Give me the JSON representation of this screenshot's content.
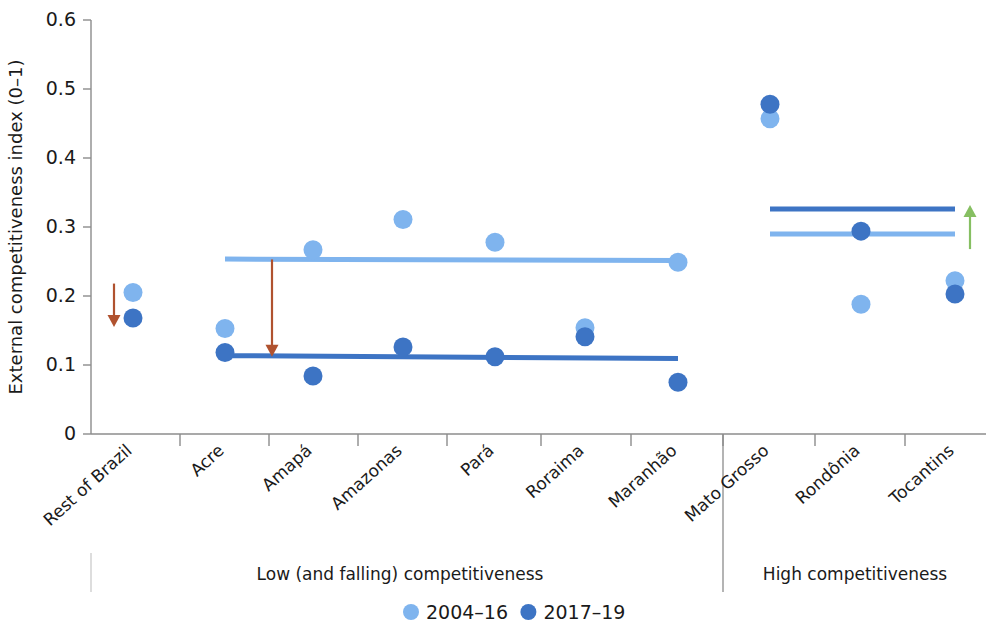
{
  "chart_data": {
    "type": "scatter",
    "title": "",
    "xlabel": "",
    "ylabel": "External competitiveness index (0–1)",
    "ylim": [
      0,
      0.6
    ],
    "yticks": [
      0,
      0.1,
      0.2,
      0.3,
      0.4,
      0.5,
      0.6
    ],
    "ytick_labels": [
      "0",
      "0.1",
      "0.2",
      "0.3",
      "0.4",
      "0.5",
      "0.6"
    ],
    "grid": false,
    "legend_position": "bottom",
    "categories": [
      "Rest of Brazil",
      "Acre",
      "Amapá",
      "Amazonas",
      "Pará",
      "Roraima",
      "Maranhão",
      "Mato Grosso",
      "Rondônia",
      "Tocantins"
    ],
    "series": [
      {
        "name": "2004–16",
        "color": "#7fb4ee",
        "values": [
          0.205,
          0.153,
          0.267,
          0.311,
          0.278,
          0.154,
          0.249,
          0.457,
          0.188,
          0.222
        ]
      },
      {
        "name": "2017–19",
        "color": "#3d74c4",
        "values": [
          0.168,
          0.118,
          0.084,
          0.126,
          0.112,
          0.141,
          0.075,
          0.478,
          0.294,
          0.203
        ]
      }
    ],
    "trend_lines": [
      {
        "series": "2004–16",
        "panel": "low",
        "color": "#7fb4ee",
        "value_start": 0.2535,
        "value_end": 0.2515,
        "x_start_category": "Acre",
        "x_end_category": "Maranhão"
      },
      {
        "series": "2017–19",
        "panel": "low",
        "color": "#3d74c4",
        "value_start": 0.1135,
        "value_end": 0.1095,
        "x_start_category": "Acre",
        "x_end_category": "Maranhão"
      },
      {
        "series": "2017–19",
        "panel": "high",
        "color": "#3d74c4",
        "value_start": 0.326,
        "value_end": 0.326,
        "x_start_category": "Mato Grosso",
        "x_end_category": "Tocantins"
      },
      {
        "series": "2004–16",
        "panel": "high",
        "color": "#7fb4ee",
        "value_start": 0.29,
        "value_end": 0.29,
        "x_start_category": "Mato Grosso",
        "x_end_category": "Tocantins"
      }
    ],
    "annotations": [
      {
        "name": "rest-of-brazil-decline-arrow",
        "direction": "down",
        "color": "#b0522f",
        "value_from": 0.218,
        "value_to": 0.155
      },
      {
        "name": "low-panel-decline-arrow",
        "direction": "down",
        "color": "#b0522f",
        "value_from": 0.253,
        "value_to": 0.112
      },
      {
        "name": "high-panel-rise-arrow",
        "direction": "up",
        "color": "#86bf62",
        "value_from": 0.268,
        "value_to": 0.332
      }
    ],
    "panels": [
      {
        "id": "low",
        "label": "Low (and falling) competitiveness",
        "categories": [
          "Rest of Brazil",
          "Acre",
          "Amapá",
          "Amazonas",
          "Pará",
          "Roraima",
          "Maranhão"
        ]
      },
      {
        "id": "high",
        "label": "High competitiveness",
        "categories": [
          "Mato Grosso",
          "Rondônia",
          "Tocantins"
        ]
      }
    ]
  },
  "legend": {
    "items": [
      {
        "label": "2004–16",
        "color": "#7fb4ee"
      },
      {
        "label": "2017–19",
        "color": "#3d74c4"
      }
    ]
  },
  "axes": {
    "y_title": "External competitiveness index (0–1)"
  }
}
